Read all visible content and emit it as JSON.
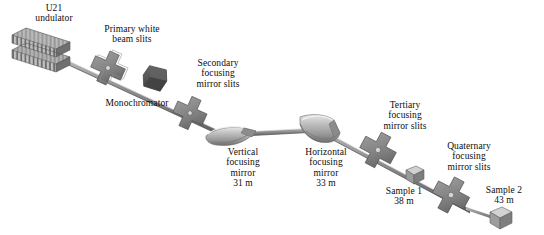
{
  "diagram": {
    "type": "optical-beamline-layout",
    "colors": {
      "beam": "#8e8e8e",
      "beam_dark": "#5e5e5e",
      "component_light": "#c9c9c9",
      "component_mid": "#9a9a9a",
      "component_dark": "#6a6a6a",
      "monochromator": "#575757",
      "background": "#ffffff",
      "text": "#0d0d0d"
    }
  },
  "components": [
    {
      "id": "undulator",
      "name": "U21 undulator",
      "label_lines": [
        "U21",
        "undulator"
      ],
      "distance": "",
      "shape": "magnet-array",
      "label_x": 54,
      "label_y": 4,
      "x": 10,
      "y": 30
    },
    {
      "id": "primary-white-beam-slits",
      "name": "Primary white beam slits",
      "label_lines": [
        "Primary white",
        "beam slits"
      ],
      "distance": "",
      "shape": "cross-slit",
      "label_x": 132,
      "label_y": 25,
      "x": 108,
      "y": 68
    },
    {
      "id": "monochromator",
      "name": "Monochromator",
      "label_lines": [
        "Monochromator"
      ],
      "distance": "",
      "shape": "crystal-block",
      "label_x": 135,
      "label_y": 99,
      "x": 155,
      "y": 78
    },
    {
      "id": "secondary-focusing-mirror-slits",
      "name": "Secondary focusing mirror slits",
      "label_lines": [
        "Secondary",
        "focusing",
        "mirror slits"
      ],
      "distance": "",
      "shape": "cross-slit",
      "label_x": 218,
      "label_y": 60,
      "x": 190,
      "y": 113
    },
    {
      "id": "vertical-focusing-mirror",
      "name": "Vertical focusing mirror",
      "label_lines": [
        "Vertical",
        "focusing",
        "mirror",
        "31 m"
      ],
      "distance": "31 m",
      "shape": "curved-mirror",
      "label_x": 242,
      "label_y": 148,
      "x": 220,
      "y": 128
    },
    {
      "id": "horizontal-focusing-mirror",
      "name": "Horizontal focusing mirror",
      "label_lines": [
        "Horizontal",
        "focusing",
        "mirror",
        "33 m"
      ],
      "distance": "33 m",
      "shape": "curved-mirror",
      "label_x": 325,
      "label_y": 148,
      "x": 300,
      "y": 120
    },
    {
      "id": "tertiary-focusing-mirror-slits",
      "name": "Tertiary focusing mirror slits",
      "label_lines": [
        "Tertiary",
        "focusing",
        "mirror slits"
      ],
      "distance": "",
      "shape": "cross-slit",
      "label_x": 405,
      "label_y": 101,
      "x": 378,
      "y": 150
    },
    {
      "id": "sample-1",
      "name": "Sample 1",
      "label_lines": [
        "Sample 1",
        "38 m"
      ],
      "distance": "38 m",
      "shape": "cube",
      "label_x": 404,
      "label_y": 187,
      "x": 414,
      "y": 170
    },
    {
      "id": "quaternary-focusing-mirror-slits",
      "name": "Quaternary focusing mirror slits",
      "label_lines": [
        "Quaternary",
        "focusing",
        "mirror slits"
      ],
      "distance": "",
      "shape": "cross-slit",
      "label_x": 468,
      "label_y": 142,
      "x": 451,
      "y": 195
    },
    {
      "id": "sample-2",
      "name": "Sample 2",
      "label_lines": [
        "Sample 2",
        "43 m"
      ],
      "distance": "43 m",
      "shape": "cube",
      "label_x": 504,
      "label_y": 186,
      "x": 499,
      "y": 213
    }
  ]
}
